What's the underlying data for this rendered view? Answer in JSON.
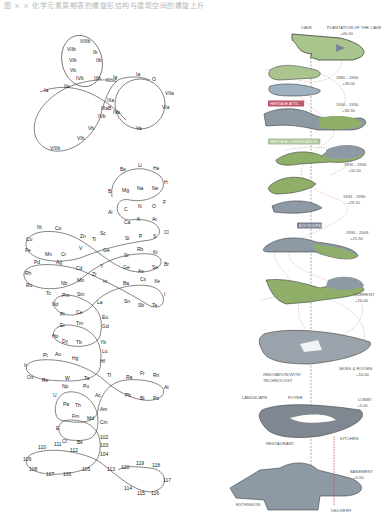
{
  "caption": "图 × ×  化学元素周期表的螺旋形结构与建筑空间的螺旋上升",
  "left_top_diagram": {
    "labels": [
      {
        "t": "VIIIb",
        "x": 80,
        "y": 43
      },
      {
        "t": "VIIb",
        "x": 67,
        "y": 51
      },
      {
        "t": "Ib",
        "x": 93,
        "y": 54
      },
      {
        "t": "VIb",
        "x": 69,
        "y": 62
      },
      {
        "t": "IIb",
        "x": 96,
        "y": 62
      },
      {
        "t": "Vb",
        "x": 70,
        "y": 72
      },
      {
        "t": "IVb",
        "x": 76,
        "y": 80
      },
      {
        "t": "IIIb",
        "x": 94,
        "y": 80
      },
      {
        "t": "IIIb/c",
        "x": 106,
        "y": 82
      },
      {
        "t": "Ia",
        "x": 113,
        "y": 79
      },
      {
        "t": "Ia",
        "x": 136,
        "y": 76
      },
      {
        "t": "O",
        "x": 152,
        "y": 81
      },
      {
        "t": "IIa",
        "x": 64,
        "y": 88
      },
      {
        "t": "Ia",
        "x": 44,
        "y": 92
      },
      {
        "t": "VIIa",
        "x": 165,
        "y": 95
      },
      {
        "t": "IIIa",
        "x": 107,
        "y": 102
      },
      {
        "t": "IIIaB",
        "x": 101,
        "y": 110
      },
      {
        "t": "IVa",
        "x": 113,
        "y": 114
      },
      {
        "t": "IVb",
        "x": 98,
        "y": 118
      },
      {
        "t": "VIa",
        "x": 162,
        "y": 109
      },
      {
        "t": "Va",
        "x": 136,
        "y": 130
      },
      {
        "t": "Vb",
        "x": 88,
        "y": 130
      },
      {
        "t": "VIb",
        "x": 77,
        "y": 140
      },
      {
        "t": "VIIIb",
        "x": 50,
        "y": 150
      }
    ]
  },
  "left_bottom_diagram": {
    "labels": [
      {
        "t": "Be",
        "x": 120,
        "y": 171
      },
      {
        "t": "Li",
        "x": 138,
        "y": 167
      },
      {
        "t": "He",
        "x": 153,
        "y": 170
      },
      {
        "t": "H",
        "x": 164,
        "y": 184
      },
      {
        "t": "B",
        "x": 108,
        "y": 193
      },
      {
        "t": "Mg",
        "x": 122,
        "y": 192
      },
      {
        "t": "Na",
        "x": 137,
        "y": 190
      },
      {
        "t": "Ne",
        "x": 152,
        "y": 190
      },
      {
        "t": "F",
        "x": 163,
        "y": 204
      },
      {
        "t": "Al",
        "x": 108,
        "y": 214
      },
      {
        "t": "C",
        "x": 124,
        "y": 211
      },
      {
        "t": "N",
        "x": 138,
        "y": 208
      },
      {
        "t": "O",
        "x": 152,
        "y": 208
      },
      {
        "t": "Ca",
        "x": 124,
        "y": 224
      },
      {
        "t": "K",
        "x": 137,
        "y": 221
      },
      {
        "t": "Ar",
        "x": 152,
        "y": 221
      },
      {
        "t": "Ni",
        "x": 37,
        "y": 229
      },
      {
        "t": "Co",
        "x": 55,
        "y": 230
      },
      {
        "t": "Sc",
        "x": 100,
        "y": 235
      },
      {
        "t": "Cl",
        "x": 164,
        "y": 234
      },
      {
        "t": "Cu",
        "x": 26,
        "y": 241
      },
      {
        "t": "Zn",
        "x": 80,
        "y": 238
      },
      {
        "t": "Ti",
        "x": 92,
        "y": 241
      },
      {
        "t": "Si",
        "x": 125,
        "y": 240
      },
      {
        "t": "P",
        "x": 139,
        "y": 238
      },
      {
        "t": "S",
        "x": 153,
        "y": 238
      },
      {
        "t": "Fe",
        "x": 25,
        "y": 252
      },
      {
        "t": "Mn",
        "x": 45,
        "y": 256
      },
      {
        "t": "Cr",
        "x": 61,
        "y": 256
      },
      {
        "t": "V",
        "x": 79,
        "y": 250
      },
      {
        "t": "Ge",
        "x": 103,
        "y": 252
      },
      {
        "t": "Rb",
        "x": 137,
        "y": 251
      },
      {
        "t": "Kr",
        "x": 153,
        "y": 254
      },
      {
        "t": "Pd",
        "x": 34,
        "y": 264
      },
      {
        "t": "Ag",
        "x": 56,
        "y": 264
      },
      {
        "t": "Sr",
        "x": 124,
        "y": 257
      },
      {
        "t": "Br",
        "x": 164,
        "y": 266
      },
      {
        "t": "Cd",
        "x": 76,
        "y": 270
      },
      {
        "t": "Y",
        "x": 100,
        "y": 268
      },
      {
        "t": "Ge",
        "x": 123,
        "y": 269
      },
      {
        "t": "As",
        "x": 138,
        "y": 273
      },
      {
        "t": "Se",
        "x": 152,
        "y": 269
      },
      {
        "t": "Rh",
        "x": 25,
        "y": 275
      },
      {
        "t": "Zr",
        "x": 92,
        "y": 276
      },
      {
        "t": "Mo",
        "x": 77,
        "y": 282
      },
      {
        "t": "In",
        "x": 103,
        "y": 283
      },
      {
        "t": "Cs",
        "x": 140,
        "y": 281
      },
      {
        "t": "Xe",
        "x": 154,
        "y": 283
      },
      {
        "t": "Ru",
        "x": 26,
        "y": 287
      },
      {
        "t": "Nb",
        "x": 61,
        "y": 285
      },
      {
        "t": "Ba",
        "x": 123,
        "y": 285
      },
      {
        "t": "Tc",
        "x": 46,
        "y": 295
      },
      {
        "t": "Pm",
        "x": 62,
        "y": 297
      },
      {
        "t": "Sm",
        "x": 77,
        "y": 296
      },
      {
        "t": "I",
        "x": 164,
        "y": 296
      },
      {
        "t": "Nd",
        "x": 52,
        "y": 306
      },
      {
        "t": "La",
        "x": 97,
        "y": 304
      },
      {
        "t": "Sn",
        "x": 124,
        "y": 303
      },
      {
        "t": "Sb",
        "x": 138,
        "y": 307
      },
      {
        "t": "Te",
        "x": 152,
        "y": 307
      },
      {
        "t": "Pr",
        "x": 60,
        "y": 316
      },
      {
        "t": "Ce",
        "x": 76,
        "y": 314
      },
      {
        "t": "Eu",
        "x": 102,
        "y": 319
      },
      {
        "t": "Er",
        "x": 60,
        "y": 327
      },
      {
        "t": "Tm",
        "x": 76,
        "y": 325
      },
      {
        "t": "Gd",
        "x": 102,
        "y": 328
      },
      {
        "t": "Ho",
        "x": 52,
        "y": 338
      },
      {
        "t": "Dy",
        "x": 62,
        "y": 343
      },
      {
        "t": "Tb",
        "x": 76,
        "y": 344
      },
      {
        "t": "Yb",
        "x": 100,
        "y": 344
      },
      {
        "t": "Lu",
        "x": 102,
        "y": 353
      },
      {
        "t": "Pt",
        "x": 43,
        "y": 357
      },
      {
        "t": "Au",
        "x": 55,
        "y": 356
      },
      {
        "t": "Hg",
        "x": 72,
        "y": 360
      },
      {
        "t": "Hf",
        "x": 100,
        "y": 363
      },
      {
        "t": "Ir",
        "x": 24,
        "y": 367
      },
      {
        "t": "Os",
        "x": 27,
        "y": 379
      },
      {
        "t": "Re",
        "x": 42,
        "y": 382
      },
      {
        "t": "W",
        "x": 65,
        "y": 380
      },
      {
        "t": "Ta",
        "x": 84,
        "y": 380
      },
      {
        "t": "Tl",
        "x": 107,
        "y": 377
      },
      {
        "t": "Ra",
        "x": 126,
        "y": 379
      },
      {
        "t": "Fr",
        "x": 140,
        "y": 375
      },
      {
        "t": "Rn",
        "x": 153,
        "y": 377
      },
      {
        "t": "At",
        "x": 164,
        "y": 389
      },
      {
        "t": "Np",
        "x": 62,
        "y": 388
      },
      {
        "t": "Pu",
        "x": 83,
        "y": 388
      },
      {
        "t": "Pb",
        "x": 125,
        "y": 397
      },
      {
        "t": "Bi",
        "x": 140,
        "y": 400
      },
      {
        "t": "Po",
        "x": 153,
        "y": 400
      },
      {
        "t": "U",
        "x": 53,
        "y": 397
      },
      {
        "t": "Ac",
        "x": 95,
        "y": 397
      },
      {
        "t": "Pa",
        "x": 63,
        "y": 406
      },
      {
        "t": "Th",
        "x": 75,
        "y": 407
      },
      {
        "t": "Am",
        "x": 100,
        "y": 411
      },
      {
        "t": "Fm",
        "x": 72,
        "y": 418
      },
      {
        "t": "Md",
        "x": 87,
        "y": 420
      },
      {
        "t": "Cm",
        "x": 100,
        "y": 424
      },
      {
        "t": "E",
        "x": 56,
        "y": 430
      },
      {
        "t": "Cf",
        "x": 62,
        "y": 443
      },
      {
        "t": "Bk",
        "x": 77,
        "y": 444
      },
      {
        "t": "102",
        "x": 100,
        "y": 439
      },
      {
        "t": "103",
        "x": 100,
        "y": 447
      },
      {
        "t": "110",
        "x": 38,
        "y": 449
      },
      {
        "t": "111",
        "x": 54,
        "y": 446
      },
      {
        "t": "112",
        "x": 70,
        "y": 452
      },
      {
        "t": "104",
        "x": 100,
        "y": 456
      },
      {
        "t": "109",
        "x": 23,
        "y": 461
      },
      {
        "t": "108",
        "x": 29,
        "y": 471
      },
      {
        "t": "107",
        "x": 46,
        "y": 476
      },
      {
        "t": "106",
        "x": 63,
        "y": 476
      },
      {
        "t": "105",
        "x": 82,
        "y": 471
      },
      {
        "t": "113",
        "x": 107,
        "y": 471
      },
      {
        "t": "120",
        "x": 121,
        "y": 469
      },
      {
        "t": "119",
        "x": 136,
        "y": 465
      },
      {
        "t": "118",
        "x": 152,
        "y": 467
      },
      {
        "t": "117",
        "x": 163,
        "y": 482
      },
      {
        "t": "114",
        "x": 124,
        "y": 490
      },
      {
        "t": "115",
        "x": 137,
        "y": 495
      },
      {
        "t": "116",
        "x": 151,
        "y": 495
      }
    ]
  },
  "right_diagram": {
    "levels": [
      {
        "name": "cave",
        "label": "CAVE",
        "x": 301,
        "y": 29
      },
      {
        "name": "plantation",
        "label": "PLANTATION OF THE CAVE",
        "x": 327,
        "y": 29,
        "sub": "+40.00",
        "sx": 340,
        "sy": 35
      },
      {
        "name": "l1",
        "label": "1880 - 1900",
        "x": 336,
        "y": 79,
        "sub": "+39.00",
        "sx": 342,
        "sy": 85
      },
      {
        "name": "l2",
        "label": "1900 - 1930",
        "x": 336,
        "y": 106,
        "sub": "+36.50",
        "sx": 342,
        "sy": 112
      },
      {
        "name": "l3",
        "label": "1930 - 1945",
        "x": 344,
        "y": 166,
        "sub": "+32.00",
        "sx": 348,
        "sy": 172
      },
      {
        "name": "l4",
        "label": "1945 - 1990",
        "x": 343,
        "y": 198,
        "sub": "+29.10",
        "sx": 347,
        "sy": 204
      },
      {
        "name": "l5",
        "label": "1990 - 2009",
        "x": 346,
        "y": 234,
        "sub": "+21.50",
        "sx": 350,
        "sy": 240
      },
      {
        "name": "current",
        "label": "CURRENT",
        "x": 354,
        "y": 296,
        "sub": "+15.00",
        "sx": 355,
        "sy": 302
      },
      {
        "name": "skies",
        "label": "SKIES & ROOMS",
        "x": 339,
        "y": 370,
        "sub": "+10.00",
        "sx": 356,
        "sy": 376
      },
      {
        "name": "innovation",
        "label": "INNOVATION WITH",
        "x": 263,
        "y": 376,
        "sub": "TECHNOLOGY",
        "sx": 263,
        "sy": 382
      },
      {
        "name": "landscape",
        "label": "LANDSCAPE",
        "x": 242,
        "y": 399
      },
      {
        "name": "foyer",
        "label": "FOYER",
        "x": 288,
        "y": 399
      },
      {
        "name": "lobby",
        "label": "LOBBY",
        "x": 358,
        "y": 401,
        "sub": "+5.00",
        "sx": 357,
        "sy": 407
      },
      {
        "name": "restaurant",
        "label": "RESTAURANT",
        "x": 266,
        "y": 445
      },
      {
        "name": "kitchen",
        "label": "KITCHEN",
        "x": 340,
        "y": 440
      },
      {
        "name": "basement",
        "label": "BASEMENT",
        "x": 350,
        "y": 473,
        "sub": "+0.00",
        "sx": 353,
        "sy": 479
      },
      {
        "name": "extension",
        "label": "EXTENSION",
        "x": 236,
        "y": 506
      },
      {
        "name": "delivery",
        "label": "DELIVERY",
        "x": 331,
        "y": 512
      }
    ],
    "tags": [
      {
        "label": "HERITAGE ATTIC",
        "x": 268,
        "y": 105,
        "color": "#c0566e"
      },
      {
        "label": "HERITAGE CONSERVATION",
        "x": 268,
        "y": 143,
        "color": "#a9c39a"
      },
      {
        "label": "ECO ROOFS",
        "x": 297,
        "y": 227,
        "color": "#7b8496"
      }
    ],
    "colors": {
      "green": "#8fae67",
      "grey": "#8d9aa6",
      "dark": "#3a3f3b",
      "dash_red": "#c4504e"
    }
  }
}
